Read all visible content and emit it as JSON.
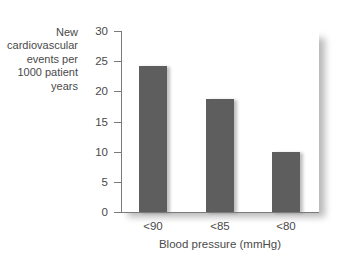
{
  "chart_data": {
    "type": "bar",
    "title": "",
    "categories": [
      "<90",
      "<85",
      "<80"
    ],
    "values": [
      24.2,
      18.7,
      10
    ],
    "xlabel": "Blood pressure (mmHg)",
    "ylabel": "New\ncardiovascular\nevents per\n1000 patient\nyears",
    "ylim": [
      0,
      30
    ],
    "yticks": [
      "0",
      "5",
      "10",
      "15",
      "20",
      "25",
      "30"
    ],
    "grid": false,
    "legend": null,
    "colors": {
      "bar": "#5e5e5e",
      "axis": "#7a7a7a",
      "text": "#4a4a4a"
    }
  }
}
